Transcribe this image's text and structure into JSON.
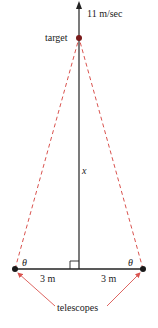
{
  "diagram": {
    "speed_label": "11 m/sec",
    "target_label": "target",
    "height_label": "x",
    "angle_left": "θ",
    "angle_right": "θ",
    "distance_left": "3 m",
    "distance_right": "3 m",
    "telescopes_label": "telescopes",
    "colors": {
      "line": "#222222",
      "sightline": "#d9534f",
      "dot": "#1a1a1a"
    }
  }
}
